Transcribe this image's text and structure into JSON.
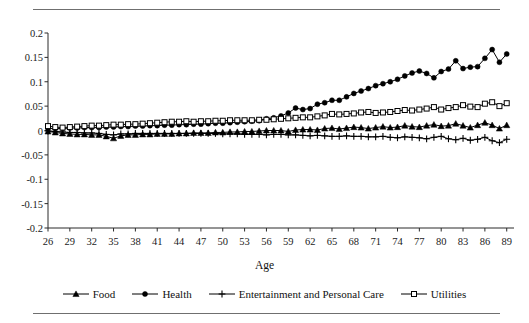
{
  "figure": {
    "x_axis_title": "Age",
    "rules": {
      "top": "horizontal-rule",
      "bottom": "horizontal-rule"
    }
  },
  "legend": {
    "position": "bottom-center",
    "entries": [
      {
        "label": "Food",
        "marker": "filled-triangle-icon",
        "color": "#000000"
      },
      {
        "label": "Health",
        "marker": "filled-circle-icon",
        "color": "#000000"
      },
      {
        "label": "Entertainment and Personal Care",
        "marker": "plus-icon",
        "color": "#000000"
      },
      {
        "label": "Utilities",
        "marker": "open-square-icon",
        "color": "#000000"
      }
    ]
  },
  "chart_data": {
    "type": "line",
    "title": "",
    "subtitle": "",
    "xlabel": "Age",
    "ylabel": "",
    "xlim": [
      26,
      90
    ],
    "ylim": [
      -0.2,
      0.2
    ],
    "grid": false,
    "legend_position": "bottom",
    "y_ticks": [
      0.2,
      0.15,
      0.1,
      0.05,
      0,
      -0.05,
      -0.1,
      -0.15,
      -0.2
    ],
    "y_tick_labels": [
      "0.2",
      "0.15",
      "0.1",
      "0.05",
      "0",
      "-0.05",
      "-0.1",
      "-0.15",
      "-0.2"
    ],
    "x_ticks": [
      26,
      29,
      32,
      35,
      38,
      41,
      44,
      47,
      50,
      53,
      56,
      59,
      62,
      65,
      68,
      71,
      74,
      77,
      80,
      83,
      86,
      89
    ],
    "x_tick_labels": [
      "26",
      "29",
      "32",
      "35",
      "38",
      "41",
      "44",
      "47",
      "50",
      "53",
      "56",
      "59",
      "62",
      "65",
      "68",
      "71",
      "74",
      "77",
      "80",
      "83",
      "86",
      "89"
    ],
    "x": [
      26,
      27,
      28,
      29,
      30,
      31,
      32,
      33,
      34,
      35,
      36,
      37,
      38,
      39,
      40,
      41,
      42,
      43,
      44,
      45,
      46,
      47,
      48,
      49,
      50,
      51,
      52,
      53,
      54,
      55,
      56,
      57,
      58,
      59,
      60,
      61,
      62,
      63,
      64,
      65,
      66,
      67,
      68,
      69,
      70,
      71,
      72,
      73,
      74,
      75,
      76,
      77,
      78,
      79,
      80,
      81,
      82,
      83,
      84,
      85,
      86,
      87,
      88,
      89
    ],
    "series": [
      {
        "name": "Food",
        "marker": "filled-triangle",
        "color": "#000000",
        "values": [
          -0.002,
          -0.004,
          -0.006,
          -0.007,
          -0.008,
          -0.008,
          -0.009,
          -0.009,
          -0.012,
          -0.016,
          -0.011,
          -0.009,
          -0.009,
          -0.008,
          -0.008,
          -0.007,
          -0.007,
          -0.007,
          -0.006,
          -0.006,
          -0.005,
          -0.005,
          -0.005,
          -0.004,
          -0.004,
          -0.003,
          -0.003,
          -0.002,
          -0.002,
          -0.001,
          0.0,
          0.0,
          0.0,
          -0.002,
          0.001,
          0.002,
          0.002,
          0.001,
          0.004,
          0.005,
          0.003,
          0.005,
          0.007,
          0.006,
          0.004,
          0.006,
          0.008,
          0.006,
          0.007,
          0.01,
          0.008,
          0.007,
          0.01,
          0.012,
          0.009,
          0.01,
          0.014,
          0.01,
          0.006,
          0.011,
          0.016,
          0.011,
          0.004,
          0.011
        ]
      },
      {
        "name": "Health",
        "marker": "filled-circle",
        "color": "#000000",
        "values": [
          0.004,
          0.004,
          0.004,
          0.005,
          0.005,
          0.006,
          0.006,
          0.006,
          0.007,
          0.007,
          0.008,
          0.008,
          0.009,
          0.009,
          0.01,
          0.01,
          0.011,
          0.011,
          0.012,
          0.012,
          0.013,
          0.013,
          0.014,
          0.015,
          0.015,
          0.016,
          0.017,
          0.018,
          0.019,
          0.02,
          0.024,
          0.026,
          0.03,
          0.036,
          0.046,
          0.043,
          0.045,
          0.054,
          0.057,
          0.062,
          0.062,
          0.069,
          0.076,
          0.081,
          0.086,
          0.092,
          0.096,
          0.1,
          0.105,
          0.112,
          0.118,
          0.122,
          0.117,
          0.108,
          0.121,
          0.126,
          0.143,
          0.127,
          0.13,
          0.131,
          0.148,
          0.166,
          0.14,
          0.157
        ]
      },
      {
        "name": "Entertainment and Personal Care",
        "marker": "plus",
        "color": "#000000",
        "values": [
          -0.001,
          -0.002,
          -0.003,
          -0.004,
          -0.004,
          -0.005,
          -0.005,
          -0.006,
          -0.008,
          -0.009,
          -0.007,
          -0.007,
          -0.006,
          -0.006,
          -0.006,
          -0.006,
          -0.006,
          -0.006,
          -0.006,
          -0.006,
          -0.006,
          -0.006,
          -0.006,
          -0.006,
          -0.007,
          -0.007,
          -0.007,
          -0.008,
          -0.008,
          -0.008,
          -0.009,
          -0.008,
          -0.008,
          -0.009,
          -0.009,
          -0.01,
          -0.011,
          -0.01,
          -0.011,
          -0.012,
          -0.012,
          -0.011,
          -0.012,
          -0.012,
          -0.013,
          -0.013,
          -0.012,
          -0.014,
          -0.015,
          -0.013,
          -0.014,
          -0.015,
          -0.017,
          -0.014,
          -0.012,
          -0.017,
          -0.019,
          -0.016,
          -0.02,
          -0.018,
          -0.014,
          -0.021,
          -0.025,
          -0.018
        ]
      },
      {
        "name": "Utilities",
        "marker": "open-square",
        "color": "#000000",
        "values": [
          0.009,
          0.007,
          0.006,
          0.007,
          0.008,
          0.009,
          0.01,
          0.01,
          0.011,
          0.012,
          0.012,
          0.013,
          0.013,
          0.014,
          0.015,
          0.016,
          0.017,
          0.018,
          0.018,
          0.019,
          0.018,
          0.019,
          0.019,
          0.02,
          0.02,
          0.021,
          0.021,
          0.021,
          0.021,
          0.022,
          0.022,
          0.023,
          0.024,
          0.025,
          0.026,
          0.027,
          0.027,
          0.029,
          0.031,
          0.034,
          0.033,
          0.034,
          0.035,
          0.037,
          0.038,
          0.036,
          0.037,
          0.038,
          0.04,
          0.042,
          0.041,
          0.043,
          0.045,
          0.048,
          0.043,
          0.046,
          0.048,
          0.052,
          0.049,
          0.048,
          0.055,
          0.058,
          0.05,
          0.056
        ]
      }
    ]
  }
}
